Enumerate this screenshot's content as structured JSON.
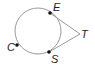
{
  "diagram": {
    "type": "circle-tangents",
    "circle": {
      "cx": 38,
      "cy": 31,
      "r": 23,
      "stroke": "#999999"
    },
    "points": [
      {
        "name": "E",
        "x": 50,
        "y": 13,
        "label_x": 53,
        "label_y": 10,
        "on_circle": true
      },
      {
        "name": "S",
        "x": 49,
        "y": 52,
        "label_x": 51,
        "label_y": 62,
        "on_circle": true
      },
      {
        "name": "C",
        "x": 17,
        "y": 45,
        "label_x": 7,
        "label_y": 50,
        "on_circle": true
      },
      {
        "name": "T",
        "x": 80,
        "y": 34,
        "label_x": 82,
        "label_y": 38,
        "on_circle": false
      }
    ],
    "segments": [
      {
        "from": "E",
        "to": "T"
      },
      {
        "from": "S",
        "to": "T"
      }
    ],
    "line_color": "#999999",
    "point_color": "#111111"
  }
}
